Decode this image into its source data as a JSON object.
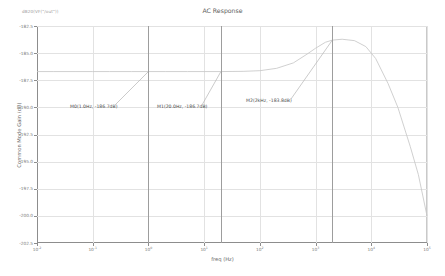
{
  "chart_data": {
    "type": "line",
    "title": "AC Response",
    "corner_label": "dB20(VF(\"/out\"))",
    "xlabel": "freq (Hz)",
    "ylabel": "Common Mode Gain (dB)",
    "xscale": "log",
    "xlim": [
      0.01,
      100000
    ],
    "ylim": [
      -202.5,
      -182.5
    ],
    "grid": true,
    "legend": "none",
    "xticks": [
      {
        "value": 0.01,
        "label": "10",
        "exp": "-2"
      },
      {
        "value": 0.1,
        "label": "10",
        "exp": "-1"
      },
      {
        "value": 1,
        "label": "10",
        "exp": "0"
      },
      {
        "value": 10,
        "label": "10",
        "exp": "1"
      },
      {
        "value": 100,
        "label": "10",
        "exp": "2"
      },
      {
        "value": 1000,
        "label": "10",
        "exp": "3"
      },
      {
        "value": 10000,
        "label": "10",
        "exp": "4"
      },
      {
        "value": 100000,
        "label": "10",
        "exp": "5"
      }
    ],
    "yticks": [
      {
        "value": -182.5,
        "label": "-182.5"
      },
      {
        "value": -185.0,
        "label": "-185.0"
      },
      {
        "value": -187.5,
        "label": "-187.5"
      },
      {
        "value": -190.0,
        "label": "-190.0"
      },
      {
        "value": -192.5,
        "label": "-192.5"
      },
      {
        "value": -195.0,
        "label": "-195.0"
      },
      {
        "value": -197.5,
        "label": "-197.5"
      },
      {
        "value": -200.0,
        "label": "-200.0"
      },
      {
        "value": -202.5,
        "label": "-202.5"
      }
    ],
    "series": [
      {
        "name": "Common Mode Gain",
        "color": "#c8c8c8",
        "x": [
          0.01,
          0.02,
          0.05,
          0.1,
          0.2,
          0.5,
          1,
          2,
          5,
          10,
          20,
          50,
          100,
          200,
          400,
          700,
          1000,
          1500,
          2000,
          3000,
          5000,
          8000,
          12000,
          20000,
          30000,
          50000,
          70000,
          100000
        ],
        "y": [
          -186.7,
          -186.7,
          -186.7,
          -186.7,
          -186.7,
          -186.7,
          -186.7,
          -186.7,
          -186.7,
          -186.7,
          -186.7,
          -186.68,
          -186.62,
          -186.4,
          -185.9,
          -185.1,
          -184.55,
          -184.0,
          -183.8,
          -183.72,
          -183.85,
          -184.4,
          -185.5,
          -187.8,
          -190.0,
          -193.6,
          -196.2,
          -200.0
        ]
      }
    ],
    "markers": [
      {
        "id": "M0",
        "label": "M0(1.0Hz, -186.7dB)",
        "freq": 1.0,
        "freq_text": "1.0Hz",
        "gain": -186.7,
        "gain_text": "-186.7dB"
      },
      {
        "id": "M1",
        "label": "M1(20.0Hz, -186.7dB)",
        "freq": 20.0,
        "freq_text": "20.0Hz",
        "gain": -186.7,
        "gain_text": "-186.7dB"
      },
      {
        "id": "M2",
        "label": "M2(2kHz, -183.8dB)",
        "freq": 2000,
        "freq_text": "2kHz",
        "gain": -183.8,
        "gain_text": "-183.8dB"
      }
    ],
    "colors": {
      "curve": "#c8c8c8",
      "grid": "#e2e2e2",
      "axis": "#8d8d8d",
      "marker_line": "#9d9d9d",
      "text": "#6a6a6a"
    }
  }
}
